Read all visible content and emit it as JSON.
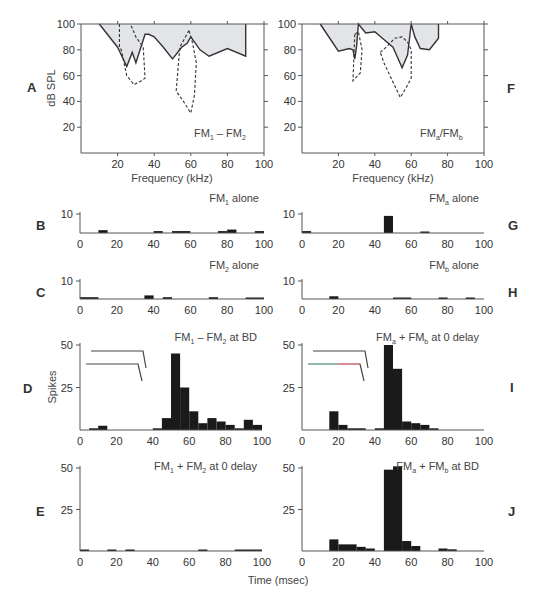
{
  "figure": {
    "panel_letters": [
      "A",
      "B",
      "C",
      "D",
      "E",
      "F",
      "G",
      "H",
      "I",
      "J"
    ],
    "tuning_xlabel": "Frequency (kHz)",
    "tuning_ylabel": "dB SPL",
    "psth_ylabel": "Spikes",
    "time_xlabel": "Time (msec)",
    "colors": {
      "axis": "#555555",
      "fill": "#e2e4e8",
      "line": "#333333",
      "bar": "#1a1a1a",
      "text": "#333333"
    }
  },
  "chart_data": [
    {
      "panel": "A",
      "type": "area",
      "title": "FM1 - FM2",
      "title_main": "FM",
      "title_sub1": "1",
      "title_sep": " – ",
      "title_sub2": "2",
      "xlabel": "Frequency (kHz)",
      "ylabel": "dB SPL",
      "xlim": [
        0,
        100
      ],
      "ylim": [
        0,
        100
      ],
      "xticks": [
        20,
        40,
        60,
        80,
        100
      ],
      "yticks": [
        20,
        40,
        60,
        80,
        100
      ],
      "series": [
        {
          "name": "threshold (solid, shaded)",
          "style": "solid",
          "x": [
            10,
            20,
            25,
            28,
            30,
            35,
            37,
            40,
            45,
            50,
            55,
            58,
            60,
            65,
            70,
            80,
            90,
            90
          ],
          "y": [
            100,
            82,
            67,
            78,
            70,
            92,
            92,
            90,
            82,
            73,
            82,
            85,
            90,
            80,
            75,
            81,
            75,
            100
          ]
        },
        {
          "name": "FM1 tuning (dashed)",
          "style": "dashed",
          "x": [
            21,
            21,
            22,
            25,
            29,
            33,
            35,
            34,
            30,
            27
          ],
          "y": [
            100,
            82,
            80,
            60,
            53,
            56,
            58,
            82,
            90,
            100
          ]
        },
        {
          "name": "FM2 tuning (dashed)",
          "style": "dashed",
          "x": [
            59,
            54,
            52,
            56,
            60,
            62,
            63,
            61,
            59
          ],
          "y": [
            95,
            82,
            48,
            40,
            31,
            45,
            70,
            85,
            95
          ]
        }
      ]
    },
    {
      "panel": "F",
      "type": "area",
      "title": "FMa/FMb",
      "title_main": "FM",
      "title_sub1": "a",
      "title_sep": "/FM",
      "title_sub2": "b",
      "xlabel": "Frequency (kHz)",
      "ylabel": "",
      "xlim": [
        0,
        100
      ],
      "ylim": [
        0,
        100
      ],
      "xticks": [
        20,
        40,
        60,
        80,
        100
      ],
      "yticks": [
        20,
        40,
        60,
        80,
        100
      ],
      "series": [
        {
          "name": "threshold (solid, shaded)",
          "style": "solid",
          "x": [
            10,
            20,
            26,
            28,
            29,
            30,
            31,
            35,
            40,
            45,
            50,
            55,
            58,
            60,
            62,
            65,
            70,
            75,
            75
          ],
          "y": [
            100,
            79,
            81,
            80,
            73,
            83,
            100,
            93,
            94,
            88,
            82,
            66,
            76,
            100,
            90,
            81,
            80,
            89,
            100
          ]
        },
        {
          "name": "FMa tuning (dashed)",
          "style": "dashed",
          "x": [
            29,
            28,
            30,
            32,
            33,
            31,
            29
          ],
          "y": [
            92,
            56,
            59,
            62,
            80,
            94,
            92
          ]
        },
        {
          "name": "FMb tuning (dashed)",
          "style": "dashed",
          "x": [
            43,
            47,
            51,
            55,
            58,
            60,
            60,
            57,
            54,
            45,
            43
          ],
          "y": [
            78,
            83,
            89,
            90,
            86,
            80,
            58,
            50,
            43,
            70,
            78
          ]
        }
      ]
    },
    {
      "panel": "B",
      "type": "bar",
      "title": "FM1 alone",
      "title_main": "FM",
      "title_sub": "1",
      "title_rest": " alone",
      "xlim": [
        0,
        100
      ],
      "ylim": [
        0,
        10
      ],
      "yticks": [
        10
      ],
      "xticks": [
        0,
        20,
        40,
        60,
        80,
        100
      ],
      "bin_width": 5,
      "bins": [
        {
          "x": 10,
          "w": 5,
          "v": 1.5
        },
        {
          "x": 40,
          "w": 5,
          "v": 1
        },
        {
          "x": 50,
          "w": 10,
          "v": 1
        },
        {
          "x": 75,
          "w": 5,
          "v": 1
        },
        {
          "x": 80,
          "w": 5,
          "v": 1.8
        },
        {
          "x": 95,
          "w": 5,
          "v": 1
        }
      ]
    },
    {
      "panel": "C",
      "type": "bar",
      "title": "FM2 alone",
      "title_main": "FM",
      "title_sub": "2",
      "title_rest": " alone",
      "xlim": [
        0,
        100
      ],
      "ylim": [
        0,
        10
      ],
      "yticks": [
        10
      ],
      "xticks": [
        0,
        20,
        40,
        60,
        80,
        100
      ],
      "bin_width": 5,
      "bins": [
        {
          "x": 0,
          "w": 10,
          "v": 1
        },
        {
          "x": 35,
          "w": 5,
          "v": 2
        },
        {
          "x": 45,
          "w": 5,
          "v": 1
        },
        {
          "x": 70,
          "w": 5,
          "v": 1
        },
        {
          "x": 90,
          "w": 10,
          "v": 0.7
        }
      ]
    },
    {
      "panel": "G",
      "type": "bar",
      "title": "FMa alone",
      "title_main": "FM",
      "title_sub": "a",
      "title_rest": " alone",
      "xlim": [
        0,
        100
      ],
      "ylim": [
        0,
        10
      ],
      "yticks": [
        10
      ],
      "xticks": [
        0,
        20,
        40,
        60,
        80,
        100
      ],
      "bin_width": 5,
      "bins": [
        {
          "x": 0,
          "w": 5,
          "v": 1
        },
        {
          "x": 45,
          "w": 5,
          "v": 9
        },
        {
          "x": 65,
          "w": 5,
          "v": 0.5
        }
      ]
    },
    {
      "panel": "H",
      "type": "bar",
      "title": "FMb alone",
      "title_main": "FM",
      "title_sub": "b",
      "title_rest": " alone",
      "xlim": [
        0,
        100
      ],
      "ylim": [
        0,
        10
      ],
      "yticks": [
        10
      ],
      "xticks": [
        0,
        20,
        40,
        60,
        80,
        100
      ],
      "bin_width": 5,
      "bins": [
        {
          "x": 15,
          "w": 5,
          "v": 1.5
        },
        {
          "x": 50,
          "w": 10,
          "v": 0.5
        },
        {
          "x": 75,
          "w": 5,
          "v": 0.5
        },
        {
          "x": 90,
          "w": 5,
          "v": 0.5
        }
      ]
    },
    {
      "panel": "D",
      "type": "bar",
      "title": "FM1 - FM2 at BD",
      "title_main": "FM",
      "title_sub": "1",
      "title_mid": " – FM",
      "title_sub2": "2",
      "title_rest": " at BD",
      "ylabel": "Spikes",
      "xlim": [
        0,
        100
      ],
      "ylim": [
        0,
        50
      ],
      "yticks": [
        25,
        50
      ],
      "xticks": [
        0,
        20,
        40,
        60,
        80,
        100
      ],
      "bin_width": 5,
      "stimulus_icon": true,
      "bins": [
        {
          "x": 5,
          "w": 5,
          "v": 1
        },
        {
          "x": 10,
          "w": 5,
          "v": 2.5
        },
        {
          "x": 40,
          "w": 5,
          "v": 1
        },
        {
          "x": 45,
          "w": 5,
          "v": 7
        },
        {
          "x": 50,
          "w": 5,
          "v": 45
        },
        {
          "x": 55,
          "w": 5,
          "v": 25
        },
        {
          "x": 60,
          "w": 5,
          "v": 11
        },
        {
          "x": 65,
          "w": 5,
          "v": 4
        },
        {
          "x": 70,
          "w": 5,
          "v": 7
        },
        {
          "x": 75,
          "w": 5,
          "v": 5
        },
        {
          "x": 80,
          "w": 5,
          "v": 3
        },
        {
          "x": 85,
          "w": 5,
          "v": 1
        },
        {
          "x": 90,
          "w": 5,
          "v": 6
        },
        {
          "x": 95,
          "w": 5,
          "v": 3
        }
      ]
    },
    {
      "panel": "E",
      "type": "bar",
      "title": "FM1 + FM2 at 0 delay",
      "title_main": "FM",
      "title_sub": "1",
      "title_mid": " + FM",
      "title_sub2": "2",
      "title_rest": " at 0 delay",
      "xlim": [
        0,
        100
      ],
      "ylim": [
        0,
        50
      ],
      "yticks": [
        25,
        50
      ],
      "xticks": [
        0,
        20,
        40,
        60,
        80,
        100
      ],
      "bin_width": 5,
      "bins": [
        {
          "x": 0,
          "w": 5,
          "v": 0.5
        },
        {
          "x": 15,
          "w": 5,
          "v": 0.5
        },
        {
          "x": 25,
          "w": 5,
          "v": 0.5
        },
        {
          "x": 65,
          "w": 5,
          "v": 0.5
        },
        {
          "x": 85,
          "w": 15,
          "v": 0.5
        }
      ]
    },
    {
      "panel": "I",
      "type": "bar",
      "title": "FMa + FMb at 0 delay",
      "title_main": "FM",
      "title_sub": "a",
      "title_mid": " + FM",
      "title_sub2": "b",
      "title_rest": " at 0 delay",
      "xlim": [
        0,
        100
      ],
      "ylim": [
        0,
        50
      ],
      "yticks": [
        25,
        50
      ],
      "xticks": [
        0,
        20,
        40,
        60,
        80,
        100
      ],
      "bin_width": 5,
      "stimulus_icon": true,
      "bins": [
        {
          "x": 15,
          "w": 5,
          "v": 11
        },
        {
          "x": 20,
          "w": 5,
          "v": 3
        },
        {
          "x": 25,
          "w": 10,
          "v": 1
        },
        {
          "x": 40,
          "w": 5,
          "v": 1
        },
        {
          "x": 45,
          "w": 5,
          "v": 50
        },
        {
          "x": 50,
          "w": 5,
          "v": 36
        },
        {
          "x": 55,
          "w": 5,
          "v": 5
        },
        {
          "x": 60,
          "w": 5,
          "v": 4
        },
        {
          "x": 65,
          "w": 5,
          "v": 3
        },
        {
          "x": 70,
          "w": 5,
          "v": 1
        }
      ]
    },
    {
      "panel": "J",
      "type": "bar",
      "title": "FMa + FMb at BD",
      "title_main": "FM",
      "title_sub": "a",
      "title_mid": " + FM",
      "title_sub2": "b",
      "title_rest": " at BD",
      "xlim": [
        0,
        100
      ],
      "ylim": [
        0,
        50
      ],
      "yticks": [
        25,
        50
      ],
      "xticks": [
        0,
        20,
        40,
        60,
        80,
        100
      ],
      "xlabel": "Time (msec)",
      "bin_width": 5,
      "bins": [
        {
          "x": 15,
          "w": 5,
          "v": 7
        },
        {
          "x": 20,
          "w": 10,
          "v": 4
        },
        {
          "x": 30,
          "w": 5,
          "v": 2.5
        },
        {
          "x": 35,
          "w": 5,
          "v": 1.5
        },
        {
          "x": 45,
          "w": 5,
          "v": 49
        },
        {
          "x": 50,
          "w": 5,
          "v": 51
        },
        {
          "x": 55,
          "w": 5,
          "v": 6
        },
        {
          "x": 60,
          "w": 5,
          "v": 3
        },
        {
          "x": 75,
          "w": 5,
          "v": 1.5
        },
        {
          "x": 80,
          "w": 5,
          "v": 1
        }
      ]
    }
  ]
}
